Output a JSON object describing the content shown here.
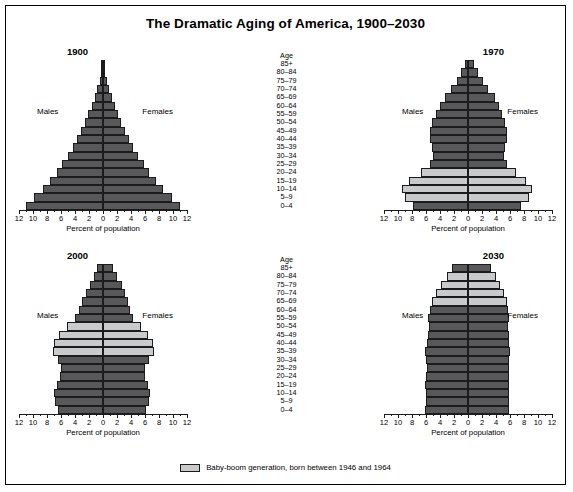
{
  "title": "The Dramatic Aging of America, 1900–2030",
  "axis": {
    "title": "Percent of population",
    "ticks": [
      12,
      10,
      8,
      6,
      4,
      2,
      0,
      2,
      4,
      6,
      8,
      10,
      12
    ],
    "max": 12
  },
  "age_header": "Age",
  "age_groups": [
    "85+",
    "80–84",
    "75–79",
    "70–74",
    "65–69",
    "60–64",
    "55–59",
    "50–54",
    "45–49",
    "40–44",
    "35–39",
    "30–34",
    "25–29",
    "20–24",
    "15–19",
    "10–14",
    "5–9",
    "0–4"
  ],
  "sex_labels": {
    "male": "Males",
    "female": "Females"
  },
  "legend": {
    "label": "Baby-boom generation, born between 1946 and 1964",
    "swatch_color": "#c9cacb"
  },
  "colors": {
    "bar_dark": "#58585a",
    "bar_light": "#c9cacb",
    "outline": "#1b1b1b",
    "background": "#ffffff"
  },
  "chart_data": {
    "type": "bar",
    "subtype": "population-pyramid",
    "title": "The Dramatic Aging of America, 1900–2030",
    "xlabel": "Percent of population",
    "ylabel": "Age",
    "xlim": [
      -12,
      12
    ],
    "grid": false,
    "legend_position": "bottom",
    "categories": [
      "85+",
      "80–84",
      "75–79",
      "70–74",
      "65–69",
      "60–64",
      "55–59",
      "50–54",
      "45–49",
      "40–44",
      "35–39",
      "30–34",
      "25–29",
      "20–24",
      "15–19",
      "10–14",
      "5–9",
      "0–4"
    ],
    "panels": [
      {
        "year": "1900",
        "position": "top-left",
        "baby_boom_groups": [],
        "series": [
          {
            "name": "Males",
            "values": [
              0.15,
              0.3,
              0.5,
              0.8,
              1.2,
              1.6,
              2.1,
              2.6,
              3.1,
              3.7,
              4.3,
              5.0,
              5.8,
              6.6,
              7.6,
              8.6,
              9.8,
              11.0
            ]
          },
          {
            "name": "Females",
            "values": [
              0.18,
              0.33,
              0.55,
              0.85,
              1.25,
              1.65,
              2.1,
              2.6,
              3.1,
              3.7,
              4.3,
              5.0,
              5.8,
              6.6,
              7.6,
              8.6,
              9.8,
              11.0
            ]
          }
        ]
      },
      {
        "year": "1970",
        "position": "top-right",
        "baby_boom_groups": [
          "20–24",
          "15–19",
          "10–14",
          "5–9"
        ],
        "series": [
          {
            "name": "Males",
            "values": [
              0.5,
              1.0,
              1.6,
              2.4,
              3.3,
              4.0,
              4.6,
              5.1,
              5.4,
              5.4,
              5.2,
              5.0,
              5.5,
              6.7,
              8.4,
              9.4,
              9.0,
              7.9
            ]
          },
          {
            "name": "Females",
            "values": [
              0.8,
              1.4,
              2.1,
              2.9,
              3.8,
              4.4,
              4.9,
              5.3,
              5.5,
              5.5,
              5.3,
              5.1,
              5.6,
              6.8,
              8.3,
              9.2,
              8.7,
              7.6
            ]
          }
        ]
      },
      {
        "year": "2000",
        "position": "bottom-left",
        "baby_boom_groups": [
          "50–54",
          "45–49",
          "40–44",
          "35–39"
        ],
        "series": [
          {
            "name": "Males",
            "values": [
              0.8,
              1.3,
              1.9,
              2.5,
              3.0,
              3.4,
              4.0,
              5.2,
              6.3,
              7.0,
              7.2,
              6.5,
              6.0,
              6.1,
              6.6,
              7.0,
              6.8,
              6.5
            ]
          },
          {
            "name": "Females",
            "values": [
              1.4,
              2.0,
              2.7,
              3.2,
              3.5,
              3.8,
              4.3,
              5.4,
              6.4,
              7.1,
              7.3,
              6.6,
              6.0,
              6.0,
              6.4,
              6.7,
              6.5,
              6.2
            ]
          }
        ]
      },
      {
        "year": "2030",
        "position": "bottom-right",
        "baby_boom_groups": [
          "80–84",
          "75–79",
          "70–74",
          "65–69"
        ],
        "series": [
          {
            "name": "Males",
            "values": [
              2.3,
              3.0,
              3.9,
              4.6,
              5.2,
              5.5,
              5.7,
              5.6,
              5.7,
              5.9,
              6.1,
              6.0,
              5.9,
              6.0,
              6.1,
              6.0,
              6.0,
              6.2
            ]
          },
          {
            "name": "Females",
            "values": [
              3.3,
              4.0,
              4.6,
              5.1,
              5.5,
              5.7,
              5.8,
              5.7,
              5.8,
              5.9,
              6.0,
              5.9,
              5.8,
              5.8,
              5.9,
              5.8,
              5.8,
              5.9
            ]
          }
        ]
      }
    ]
  }
}
